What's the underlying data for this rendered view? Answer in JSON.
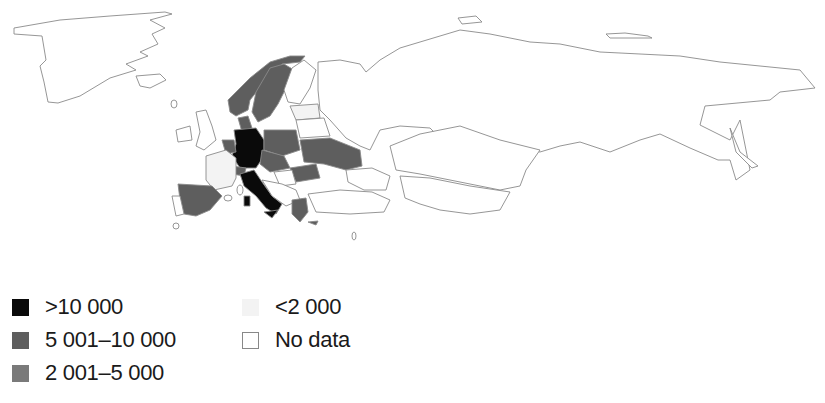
{
  "map": {
    "type": "choropleth",
    "region": "Europe and Northern Asia",
    "colors": {
      "gt_10000": "#0a0a0a",
      "5001_10000": "#5e5e5e",
      "2001_5000": "#7a7a7a",
      "lt_2000": "#f3f3f3",
      "no_data": "#ffffff",
      "border": "#8a8a8a"
    },
    "classified_regions": {
      "gt_10000": [
        "Germany",
        "Italy"
      ],
      "5001_10000": [
        "Norway",
        "Sweden",
        "Denmark",
        "Poland",
        "Ukraine",
        "Spain",
        "Austria",
        "Czechia",
        "Greece",
        "Belgium",
        "Switzerland",
        "Romania",
        "Moldova",
        "Hungary",
        "Cyprus"
      ],
      "lt_2000": [
        "France",
        "Latvia",
        "Lithuania"
      ]
    }
  },
  "legend": {
    "items": [
      {
        "label": ">10 000",
        "color": "#0a0a0a"
      },
      {
        "label": "5 001–10 000",
        "color": "#5e5e5e"
      },
      {
        "label": "2 001–5 000",
        "color": "#7a7a7a"
      },
      {
        "label": "<2 000",
        "color": "#f3f3f3"
      },
      {
        "label": "No data",
        "color": "#ffffff"
      }
    ]
  }
}
